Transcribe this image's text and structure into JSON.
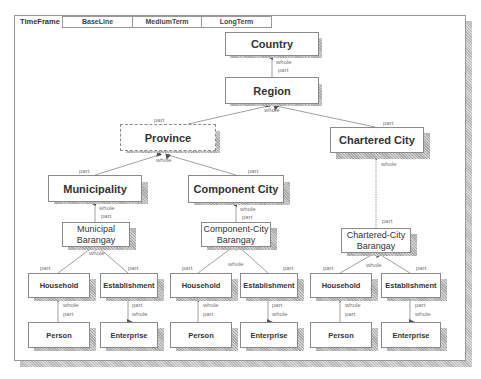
{
  "toolbar": {
    "timeframe_label": "TimeFrame",
    "tabs": [
      "BaseLine",
      "MediumTerm",
      "LongTerm"
    ]
  },
  "nodes": {
    "country": "Country",
    "region": "Region",
    "province": "Province",
    "chartered_city": "Chartered City",
    "municipality": "Municipality",
    "component_city": "Component City",
    "municipal_barangay_1": "Municipal",
    "municipal_barangay_2": "Barangay",
    "component_city_barangay_1": "Component-City",
    "component_city_barangay_2": "Barangay",
    "chartered_city_barangay_1": "Chartered-City",
    "chartered_city_barangay_2": "Barangay",
    "household": "Household",
    "establishment": "Establishment",
    "person": "Person",
    "enterprise": "Enterprise"
  },
  "edge_labels": {
    "whole": "whole",
    "part": "part"
  },
  "colors": {
    "border": "#8a8a8a",
    "shadow": "#b0b0b0",
    "line": "#888888",
    "label": "#777777"
  }
}
